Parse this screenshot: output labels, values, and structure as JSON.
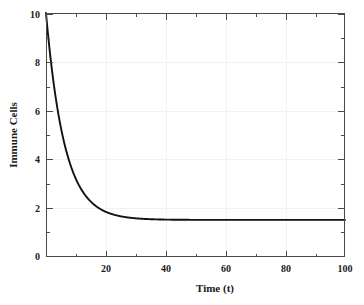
{
  "chart_data": {
    "type": "line",
    "title": "",
    "xlabel": "Time (t)",
    "ylabel": "Immune Cells",
    "xlim": [
      0,
      100
    ],
    "ylim": [
      0,
      10
    ],
    "xticks": [
      20,
      40,
      60,
      80,
      100
    ],
    "xtick_labels": [
      "20",
      "40",
      "60",
      "80",
      "100"
    ],
    "yticks": [
      0,
      2,
      4,
      6,
      8,
      10
    ],
    "ytick_labels": [
      "0",
      "2",
      "4",
      "6",
      "8",
      "10"
    ],
    "grid": true,
    "legend": false,
    "line_color": "#111111",
    "series": [
      {
        "name": "Immune Cells",
        "x": [
          0,
          0.5,
          1,
          1.5,
          2,
          2.5,
          3,
          3.5,
          4,
          4.5,
          5,
          5.5,
          6,
          6.5,
          7,
          7.5,
          8,
          8.5,
          9,
          9.5,
          10,
          11,
          12,
          13,
          14,
          15,
          16,
          17,
          18,
          19,
          20,
          22,
          24,
          26,
          28,
          30,
          35,
          40,
          45,
          50,
          55,
          60,
          65,
          70,
          75,
          80,
          85,
          90,
          95,
          100
        ],
        "values": [
          10.0,
          9.25,
          8.57,
          7.96,
          7.41,
          6.91,
          6.46,
          6.05,
          5.68,
          5.35,
          5.05,
          4.78,
          4.53,
          4.31,
          4.11,
          3.93,
          3.77,
          3.62,
          3.49,
          3.37,
          3.26,
          3.08,
          2.93,
          2.8,
          2.7,
          2.2,
          2.05,
          1.94,
          1.85,
          1.78,
          1.73,
          1.66,
          1.62,
          1.59,
          1.57,
          1.56,
          1.54,
          1.53,
          1.53,
          1.52,
          1.52,
          1.52,
          1.52,
          1.52,
          1.52,
          1.52,
          1.52,
          1.52,
          1.52,
          1.52
        ]
      }
    ],
    "plateau_value": 1.52,
    "initial_value": 10.0
  }
}
